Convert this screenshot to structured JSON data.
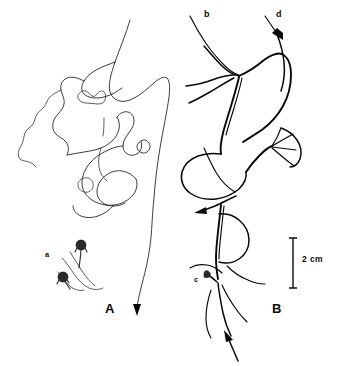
{
  "figure": {
    "type": "line-drawing",
    "background_color": "#ffffff",
    "ink_color": "#0a0a0a",
    "width": 337,
    "height": 366,
    "panels": [
      {
        "id": "A",
        "label": "A",
        "label_x": 110,
        "label_y": 303,
        "description": "thin tangled filament trace with two small stalked polyps",
        "line_style": "thin",
        "annotations": [
          {
            "key": "a",
            "label": "a",
            "x": 46,
            "y": 252,
            "description": "small stalked polyps on filament"
          }
        ]
      },
      {
        "id": "B",
        "label": "B",
        "label_x": 276,
        "label_y": 303,
        "description": "thick bundled tapering filament trace with directional arrowheads",
        "line_style": "thick",
        "annotations": [
          {
            "key": "b",
            "label": "b",
            "x": 205,
            "y": 12,
            "description": "upper left branch terminus"
          },
          {
            "key": "d",
            "label": "d",
            "x": 277,
            "y": 12,
            "description": "upper right branch with arrowhead"
          },
          {
            "key": "c",
            "label": "c",
            "x": 195,
            "y": 277,
            "description": "lower attachment node"
          }
        ]
      }
    ],
    "scale_bar": {
      "label": "2 cm",
      "label_x": 303,
      "label_y": 255,
      "orientation": "vertical",
      "x": 293,
      "y_top": 238,
      "y_bottom": 288,
      "cap_half_width": 4,
      "color": "#1a1a1a"
    }
  }
}
